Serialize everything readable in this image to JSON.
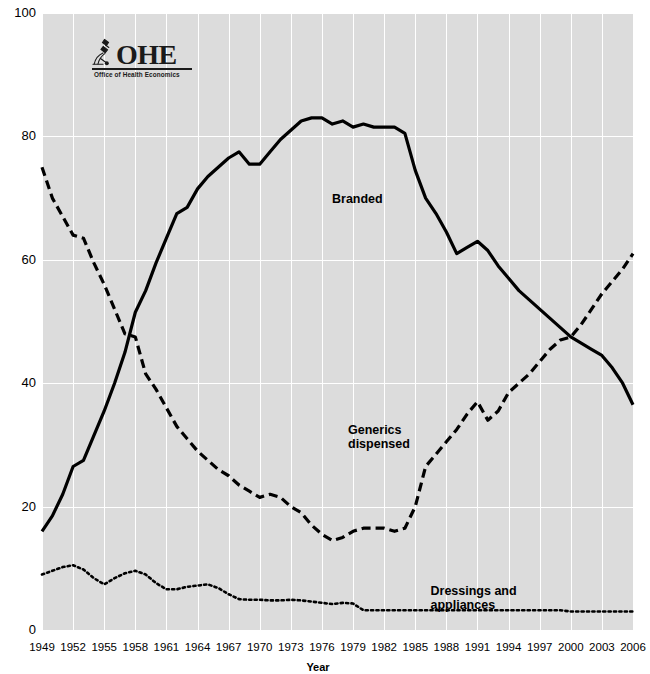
{
  "logo": {
    "name": "ohe-logo",
    "title": "OHE",
    "subtitle": "Office of Health Economics",
    "mark": "microscope-icon"
  },
  "chart_data": {
    "type": "line",
    "title": "",
    "xlabel": "Year",
    "ylabel": "",
    "xlim": [
      1949,
      2006
    ],
    "ylim": [
      0,
      100
    ],
    "grid": true,
    "legend_position": "inline-annotations",
    "x_tick_labels": [
      "1949",
      "1952",
      "1955",
      "1958",
      "1961",
      "1964",
      "1967",
      "1970",
      "1973",
      "1976",
      "1979",
      "1982",
      "1985",
      "1988",
      "1991",
      "1994",
      "1997",
      "2000",
      "2003",
      "2006"
    ],
    "y_tick_labels": [
      "0",
      "20",
      "40",
      "60",
      "80",
      "100"
    ],
    "y_ticks": [
      0,
      20,
      40,
      60,
      80,
      100
    ],
    "x": [
      1949,
      1950,
      1951,
      1952,
      1953,
      1954,
      1955,
      1956,
      1957,
      1958,
      1959,
      1960,
      1961,
      1962,
      1963,
      1964,
      1965,
      1966,
      1967,
      1968,
      1969,
      1970,
      1971,
      1972,
      1973,
      1974,
      1975,
      1976,
      1977,
      1978,
      1979,
      1980,
      1981,
      1982,
      1983,
      1984,
      1985,
      1986,
      1987,
      1988,
      1989,
      1990,
      1991,
      1992,
      1993,
      1994,
      1995,
      1996,
      1997,
      1998,
      1999,
      2000,
      2001,
      2002,
      2003,
      2004,
      2005,
      2006
    ],
    "series": [
      {
        "name": "Branded",
        "label": "Branded",
        "style": "solid",
        "color": "#000000",
        "label_x": 1977.0,
        "label_y": 71.0,
        "values": [
          16.0,
          18.5,
          22.0,
          26.5,
          27.5,
          31.5,
          35.5,
          40.0,
          45.0,
          51.5,
          55.0,
          59.5,
          63.5,
          67.5,
          68.5,
          71.5,
          73.5,
          75.0,
          76.5,
          77.5,
          75.5,
          75.5,
          77.5,
          79.5,
          81.0,
          82.5,
          83.0,
          83.0,
          82.0,
          82.5,
          81.5,
          82.0,
          81.5,
          81.5,
          81.5,
          80.5,
          74.5,
          70.0,
          67.5,
          64.5,
          61.0,
          62.0,
          63.0,
          61.5,
          59.0,
          57.0,
          55.0,
          53.5,
          52.0,
          50.5,
          49.0,
          47.5,
          46.5,
          45.5,
          44.5,
          42.5,
          40.0,
          36.5
        ]
      },
      {
        "name": "Generics dispensed",
        "label": "Generics\ndispensed",
        "style": "dashed",
        "color": "#000000",
        "label_x": 1978.5,
        "label_y": 33.5,
        "values": [
          75.0,
          70.0,
          67.0,
          64.0,
          63.5,
          59.5,
          56.0,
          52.0,
          48.0,
          47.5,
          41.5,
          39.0,
          36.0,
          33.0,
          31.0,
          29.0,
          27.5,
          26.0,
          25.0,
          23.5,
          22.5,
          21.5,
          22.0,
          21.5,
          20.0,
          19.0,
          17.0,
          15.5,
          14.5,
          15.0,
          16.0,
          16.5,
          16.5,
          16.5,
          16.0,
          16.5,
          20.0,
          26.5,
          28.5,
          30.5,
          32.5,
          35.0,
          37.0,
          34.0,
          35.5,
          38.5,
          40.0,
          41.5,
          43.5,
          45.5,
          47.0,
          47.5,
          49.5,
          52.0,
          54.5,
          56.5,
          58.5,
          61.0
        ]
      },
      {
        "name": "Dressings and appliances",
        "label": "Dressings and appliances",
        "style": "dotted",
        "color": "#000000",
        "label_x": 1993.0,
        "label_y": 7.5,
        "values": [
          9.0,
          9.6,
          10.2,
          10.5,
          9.8,
          8.4,
          7.4,
          8.4,
          9.2,
          9.6,
          9.0,
          7.6,
          6.6,
          6.6,
          7.0,
          7.2,
          7.4,
          6.8,
          5.8,
          5.0,
          4.9,
          4.9,
          4.8,
          4.8,
          4.9,
          4.8,
          4.6,
          4.4,
          4.2,
          4.4,
          4.3,
          3.2,
          3.2,
          3.2,
          3.2,
          3.2,
          3.2,
          3.2,
          3.2,
          3.2,
          3.2,
          3.2,
          3.2,
          3.2,
          3.2,
          3.2,
          3.2,
          3.2,
          3.2,
          3.2,
          3.2,
          3.0,
          3.0,
          3.0,
          3.0,
          3.0,
          3.0,
          3.0
        ]
      }
    ]
  }
}
